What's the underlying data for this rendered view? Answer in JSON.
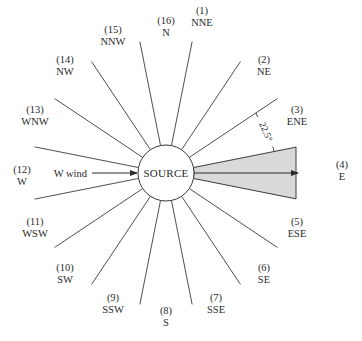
{
  "diagram": {
    "center": {
      "x": 166,
      "y": 173
    },
    "source_radius": 28,
    "source_label": "SOURCE",
    "boundary_line_outer_radius": 134,
    "boundary_angle_step_deg": 22.5,
    "boundary_angle_offset_deg": 11.25,
    "line_color": "#3a3a3a",
    "sector_fill": "#d9d9d9",
    "sector": {
      "direction": "E",
      "half_angle_deg": 11.25,
      "outer_x": 296
    },
    "plume_arrow": {
      "from_x": 194,
      "to_x": 298,
      "y": 173
    },
    "wind_label": "W wind",
    "wind_arrow": {
      "from_x": 92,
      "to_x": 137,
      "y": 173
    },
    "angle_annotation": "22.5°",
    "directions": [
      {
        "num": "(1)",
        "name": "NNE",
        "x": 202,
        "y": 14
      },
      {
        "num": "(2)",
        "name": "NE",
        "x": 264,
        "y": 63
      },
      {
        "num": "(3)",
        "name": "ENE",
        "x": 297,
        "y": 113
      },
      {
        "num": "(4)",
        "name": "E",
        "x": 342,
        "y": 168
      },
      {
        "num": "(5)",
        "name": "ESE",
        "x": 297,
        "y": 225
      },
      {
        "num": "(6)",
        "name": "SE",
        "x": 264,
        "y": 271
      },
      {
        "num": "(7)",
        "name": "SSE",
        "x": 216,
        "y": 301
      },
      {
        "num": "(8)",
        "name": "S",
        "x": 166,
        "y": 314
      },
      {
        "num": "(9)",
        "name": "SSW",
        "x": 113,
        "y": 301
      },
      {
        "num": "(10)",
        "name": "SW",
        "x": 65,
        "y": 271
      },
      {
        "num": "(11)",
        "name": "WSW",
        "x": 35,
        "y": 225
      },
      {
        "num": "(12)",
        "name": "W",
        "x": 22,
        "y": 173
      },
      {
        "num": "(13)",
        "name": "WNW",
        "x": 35,
        "y": 113
      },
      {
        "num": "(14)",
        "name": "NW",
        "x": 65,
        "y": 63
      },
      {
        "num": "(15)",
        "name": "NNW",
        "x": 113,
        "y": 33
      },
      {
        "num": "(16)",
        "name": "N",
        "x": 166,
        "y": 24
      }
    ]
  }
}
